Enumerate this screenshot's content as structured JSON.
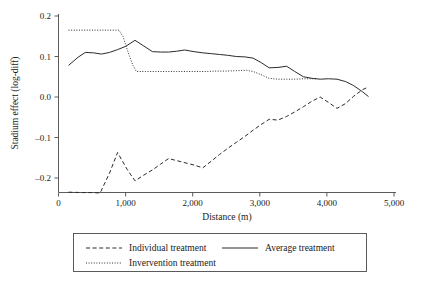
{
  "chart_data": {
    "type": "line",
    "title": "",
    "xlabel": "Distance (m)",
    "ylabel": "Stadium effect (log-diff)",
    "xlim": [
      0,
      5000
    ],
    "ylim": [
      -0.26,
      0.21
    ],
    "grid": false,
    "legend_position": "bottom",
    "xticks": [
      0,
      1000,
      2000,
      3000,
      4000,
      5000
    ],
    "xtick_labels": [
      "0",
      "1,000",
      "2,000",
      "3,000",
      "4,000",
      "5,000"
    ],
    "yticks": [
      0.2,
      0.1,
      0.0,
      -0.1,
      -0.2
    ],
    "ytick_labels": [
      "0.2",
      "0.1",
      "0.0",
      "–0.1",
      "–0.2"
    ],
    "series": [
      {
        "name": "Individual treatment",
        "style": "dashed",
        "color": "#2b2b2b",
        "x": [
          150,
          380,
          500,
          620,
          760,
          880,
          1020,
          1140,
          1270,
          1400,
          1520,
          1640,
          1760,
          1900,
          2020,
          2150,
          2280,
          2400,
          2520,
          2650,
          2780,
          2900,
          3020,
          3140,
          3270,
          3400,
          3520,
          3650,
          3780,
          3900,
          4020,
          4150,
          4280,
          4400,
          4530,
          4620
        ],
        "y": [
          -0.235,
          -0.236,
          -0.236,
          -0.237,
          -0.188,
          -0.137,
          -0.178,
          -0.207,
          -0.193,
          -0.18,
          -0.166,
          -0.152,
          -0.157,
          -0.163,
          -0.168,
          -0.175,
          -0.158,
          -0.142,
          -0.127,
          -0.112,
          -0.097,
          -0.082,
          -0.068,
          -0.055,
          -0.057,
          -0.048,
          -0.037,
          -0.024,
          -0.01,
          0.0,
          -0.013,
          -0.028,
          -0.016,
          0.002,
          0.018,
          0.025
        ]
      },
      {
        "name": "Average treatment",
        "style": "solid",
        "color": "#2b2b2b",
        "x": [
          150,
          290,
          400,
          520,
          640,
          760,
          880,
          1000,
          1140,
          1270,
          1400,
          1520,
          1640,
          1760,
          1880,
          2020,
          2150,
          2280,
          2400,
          2520,
          2650,
          2780,
          2900,
          3020,
          3140,
          3270,
          3400,
          3520,
          3650,
          3780,
          3900,
          4020,
          4150,
          4280,
          4400,
          4530,
          4620
        ],
        "y": [
          0.078,
          0.098,
          0.11,
          0.109,
          0.106,
          0.11,
          0.117,
          0.125,
          0.14,
          0.126,
          0.112,
          0.111,
          0.111,
          0.113,
          0.116,
          0.112,
          0.109,
          0.107,
          0.105,
          0.103,
          0.1,
          0.099,
          0.096,
          0.085,
          0.072,
          0.073,
          0.076,
          0.063,
          0.05,
          0.046,
          0.044,
          0.045,
          0.044,
          0.038,
          0.028,
          0.013,
          0.001
        ]
      },
      {
        "name": "Invervention treatment",
        "style": "dotted",
        "color": "#2b2b2b",
        "x": [
          150,
          400,
          650,
          900,
          960,
          1010,
          1060,
          1110,
          1160,
          1300,
          1450,
          1600,
          1760,
          1900,
          2050,
          2200,
          2350,
          2500,
          2650,
          2800,
          2900,
          3020,
          3140,
          3270,
          3400,
          3520,
          3650,
          3780,
          3860
        ],
        "y": [
          0.165,
          0.165,
          0.165,
          0.165,
          0.15,
          0.124,
          0.1,
          0.078,
          0.063,
          0.063,
          0.063,
          0.063,
          0.063,
          0.063,
          0.063,
          0.063,
          0.064,
          0.064,
          0.065,
          0.066,
          0.063,
          0.055,
          0.046,
          0.044,
          0.044,
          0.044,
          0.045,
          0.045,
          0.045
        ]
      }
    ]
  },
  "legend": {
    "entries": [
      {
        "label": "Individual treatment",
        "style": "dashed"
      },
      {
        "label": "Average treatment",
        "style": "solid"
      },
      {
        "label": "Invervention treatment",
        "style": "dotted"
      }
    ]
  }
}
